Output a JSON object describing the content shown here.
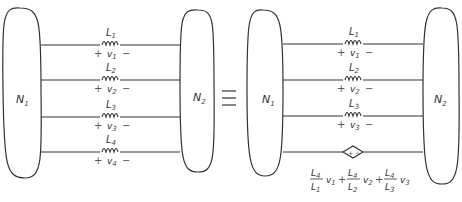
{
  "left_circuit": {
    "network1": {
      "label": "N",
      "sub": "1"
    },
    "network2": {
      "label": "N",
      "sub": "2"
    },
    "branches": [
      {
        "inductor": "L",
        "inductor_sub": "1",
        "voltage": "v",
        "voltage_sub": "1",
        "plus": "+",
        "minus": "−"
      },
      {
        "inductor": "L",
        "inductor_sub": "2",
        "voltage": "v",
        "voltage_sub": "2",
        "plus": "+",
        "minus": "−"
      },
      {
        "inductor": "L",
        "inductor_sub": "3",
        "voltage": "v",
        "voltage_sub": "3",
        "plus": "+",
        "minus": "−"
      },
      {
        "inductor": "L",
        "inductor_sub": "4",
        "voltage": "v",
        "voltage_sub": "4",
        "plus": "+",
        "minus": "−"
      }
    ]
  },
  "equivalence_symbol": "≡",
  "right_circuit": {
    "network1": {
      "label": "N",
      "sub": "1"
    },
    "network2": {
      "label": "N",
      "sub": "2"
    },
    "branches": [
      {
        "inductor": "L",
        "inductor_sub": "1",
        "voltage": "v",
        "voltage_sub": "1",
        "plus": "+",
        "minus": "−"
      },
      {
        "inductor": "L",
        "inductor_sub": "2",
        "voltage": "v",
        "voltage_sub": "2",
        "plus": "+",
        "minus": "−"
      },
      {
        "inductor": "L",
        "inductor_sub": "3",
        "voltage": "v",
        "voltage_sub": "3",
        "plus": "+",
        "minus": "−"
      }
    ],
    "dependent_source": {
      "symbol": "+ −",
      "terms": [
        {
          "num": "L",
          "num_sub": "4",
          "den": "L",
          "den_sub": "1",
          "var": "v",
          "var_sub": "1"
        },
        {
          "num": "L",
          "num_sub": "4",
          "den": "L",
          "den_sub": "2",
          "var": "v",
          "var_sub": "2"
        },
        {
          "num": "L",
          "num_sub": "4",
          "den": "L",
          "den_sub": "3",
          "var": "v",
          "var_sub": "3"
        }
      ],
      "plus": "+"
    }
  }
}
